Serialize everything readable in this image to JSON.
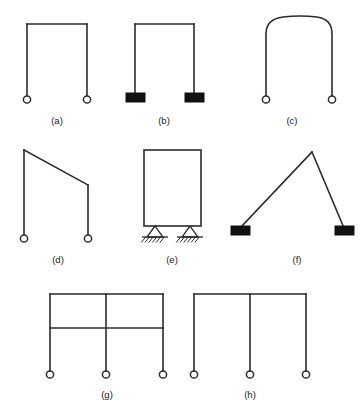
{
  "figure": {
    "background_color": "#ffffff",
    "line_color": "#2b2b2b",
    "support_fill_color": "#111111",
    "caption_color": "#1a1a1a",
    "panel_count": 8
  },
  "panels": [
    {
      "id": "a",
      "label": "(a)",
      "label_x": 57,
      "label_y": 124,
      "description": "Portal frame, straight beam, two columns, pinned supports",
      "beam": {
        "x1": 27,
        "y1": 24,
        "x2": 87,
        "y2": 24
      },
      "columns": [
        {
          "x1": 27,
          "y1": 24,
          "x2": 27,
          "y2": 96
        },
        {
          "x1": 87,
          "y1": 24,
          "x2": 87,
          "y2": 96
        }
      ],
      "supports": [
        {
          "type": "pin-circle",
          "cx": 27,
          "cy": 99.5,
          "r": 3.6
        },
        {
          "type": "pin-circle",
          "cx": 87,
          "cy": 99.5,
          "r": 3.6
        }
      ]
    },
    {
      "id": "b",
      "label": "(b)",
      "label_x": 164,
      "label_y": 124,
      "description": "Portal frame, straight beam, two columns, fixed base blocks",
      "beam": {
        "x1": 135,
        "y1": 24,
        "x2": 194,
        "y2": 24
      },
      "columns": [
        {
          "x1": 135,
          "y1": 24,
          "x2": 135,
          "y2": 93
        },
        {
          "x1": 194,
          "y1": 24,
          "x2": 194,
          "y2": 93
        }
      ],
      "supports": [
        {
          "type": "fixed-block",
          "x": 126,
          "y": 93,
          "w": 19,
          "h": 9
        },
        {
          "type": "fixed-block",
          "x": 185,
          "y": 93,
          "w": 19,
          "h": 9
        }
      ]
    },
    {
      "id": "c",
      "label": "(c)",
      "label_x": 292,
      "label_y": 124,
      "description": "Frame with curved arched top beam, pinned supports",
      "arch_path": "M 266 96 L 266 34 Q 266 19 283 17 Q 300 15 317 17 Q 332 19 332 34 L 332 96",
      "supports": [
        {
          "type": "pin-circle",
          "cx": 266,
          "cy": 99.5,
          "r": 3.6
        },
        {
          "type": "pin-circle",
          "cx": 332,
          "cy": 99.5,
          "r": 3.6
        }
      ]
    },
    {
      "id": "d",
      "label": "(d)",
      "label_x": 58,
      "label_y": 263,
      "description": "Frame with sloping beam, unequal column heights, pinned supports",
      "beam": {
        "x1": 24,
        "y1": 150,
        "x2": 88,
        "y2": 185
      },
      "columns": [
        {
          "x1": 24,
          "y1": 150,
          "x2": 24,
          "y2": 235
        },
        {
          "x1": 88,
          "y1": 185,
          "x2": 88,
          "y2": 235
        }
      ],
      "supports": [
        {
          "type": "pin-circle",
          "cx": 24,
          "cy": 238.5,
          "r": 3.6
        },
        {
          "type": "pin-circle",
          "cx": 88,
          "cy": 238.5,
          "r": 3.6
        }
      ]
    },
    {
      "id": "e",
      "label": "(e)",
      "label_x": 172,
      "label_y": 263,
      "description": "Closed rectangular frame with bottom beam on pin triangle supports with hatched ground",
      "rect": {
        "x": 144,
        "y": 150,
        "w": 57,
        "h": 76
      },
      "supports": [
        {
          "type": "pin-triangle",
          "apex_x": 155,
          "apex_y": 226,
          "half_width": 8,
          "height": 11,
          "ground_y": 237,
          "ground_x1": 142,
          "ground_x2": 168,
          "hatch_count": 6
        },
        {
          "type": "pin-triangle",
          "apex_x": 190,
          "apex_y": 226,
          "half_width": 8,
          "height": 11,
          "ground_y": 237,
          "ground_x1": 177,
          "ground_x2": 203,
          "hatch_count": 6
        }
      ]
    },
    {
      "id": "f",
      "label": "(f)",
      "label_x": 297,
      "label_y": 263,
      "description": "Asymmetric gable A-frame, apex right of center, fixed base blocks",
      "members": [
        {
          "x1": 240,
          "y1": 228,
          "x2": 312,
          "y2": 152
        },
        {
          "x1": 312,
          "y1": 152,
          "x2": 344,
          "y2": 228
        }
      ],
      "supports": [
        {
          "type": "fixed-block",
          "x": 231,
          "y": 226,
          "w": 19,
          "h": 9
        },
        {
          "type": "fixed-block",
          "x": 335,
          "y": 226,
          "w": 19,
          "h": 9
        }
      ]
    },
    {
      "id": "g",
      "label": "(g)",
      "label_x": 107,
      "label_y": 398,
      "description": "Two-story two-bay frame, upper beam, mid beam, three columns, pinned supports",
      "top_beam": {
        "x1": 50,
        "y1": 294,
        "x2": 163,
        "y2": 294
      },
      "mid_beam": {
        "x1": 50,
        "y1": 328,
        "x2": 163,
        "y2": 328
      },
      "columns": [
        {
          "x1": 50,
          "y1": 294,
          "x2": 50,
          "y2": 371
        },
        {
          "x1": 106,
          "y1": 294,
          "x2": 106,
          "y2": 371
        },
        {
          "x1": 163,
          "y1": 294,
          "x2": 163,
          "y2": 371
        }
      ],
      "supports": [
        {
          "type": "pin-circle",
          "cx": 50,
          "cy": 374.5,
          "r": 3.6
        },
        {
          "type": "pin-circle",
          "cx": 106,
          "cy": 374.5,
          "r": 3.6
        },
        {
          "type": "pin-circle",
          "cx": 163,
          "cy": 374.5,
          "r": 3.6
        }
      ]
    },
    {
      "id": "h",
      "label": "(h)",
      "label_x": 250,
      "label_y": 398,
      "description": "Single-story two-bay frame, one top beam, three columns, pinned supports",
      "top_beam": {
        "x1": 194,
        "y1": 294,
        "x2": 306,
        "y2": 294
      },
      "columns": [
        {
          "x1": 194,
          "y1": 294,
          "x2": 194,
          "y2": 371
        },
        {
          "x1": 250,
          "y1": 294,
          "x2": 250,
          "y2": 371
        },
        {
          "x1": 306,
          "y1": 294,
          "x2": 306,
          "y2": 371
        }
      ],
      "supports": [
        {
          "type": "pin-circle",
          "cx": 194,
          "cy": 374.5,
          "r": 3.6
        },
        {
          "type": "pin-circle",
          "cx": 250,
          "cy": 374.5,
          "r": 3.6
        },
        {
          "type": "pin-circle",
          "cx": 306,
          "cy": 374.5,
          "r": 3.6
        }
      ]
    }
  ]
}
